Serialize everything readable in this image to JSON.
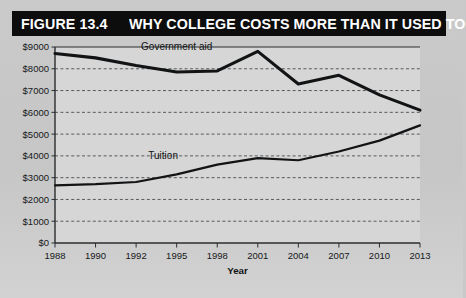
{
  "header": {
    "figure_number": "FIGURE 13.4",
    "title": "WHY COLLEGE COSTS MORE THAN IT USED TO",
    "bar_color": "#0d0d0d",
    "text_color": "#ffffff"
  },
  "colors": {
    "background": "#c9c9c9",
    "plot_background": "#d6d6d6",
    "axis": "#2a2c2e",
    "gridline": "#4a4c4e",
    "line": "#111315"
  },
  "chart_data": {
    "type": "line",
    "title": "WHY COLLEGE COSTS MORE THAN IT USED TO",
    "xlabel": "Year",
    "ylabel": "",
    "x": [
      1988,
      1990,
      1992,
      1995,
      1998,
      2001,
      2004,
      2007,
      2010,
      2013
    ],
    "categories": [
      "1988",
      "1990",
      "1992",
      "1995",
      "1998",
      "2001",
      "2004",
      "2007",
      "2010",
      "2013"
    ],
    "ylim": [
      0,
      9000
    ],
    "ytick_values": [
      0,
      1000,
      2000,
      3000,
      4000,
      5000,
      6000,
      7000,
      8000,
      9000
    ],
    "ytick_labels": [
      "$0",
      "$1000",
      "$2000",
      "$3000",
      "$4000",
      "$5000",
      "$6000",
      "$7000",
      "$8000",
      "$9000"
    ],
    "grid": true,
    "grid_style": "dashed-horizontal",
    "legend": "inline-series-labels",
    "series": [
      {
        "name": "Government aid",
        "label": "Government aid",
        "label_x": 1995,
        "values": [
          8700,
          8500,
          8150,
          7850,
          7900,
          8800,
          7300,
          7700,
          6800,
          6100
        ]
      },
      {
        "name": "Tuition",
        "label": "Tuition",
        "label_x": 1994,
        "values": [
          2650,
          2700,
          2800,
          3150,
          3600,
          3900,
          3800,
          4200,
          4700,
          5400
        ]
      }
    ]
  }
}
